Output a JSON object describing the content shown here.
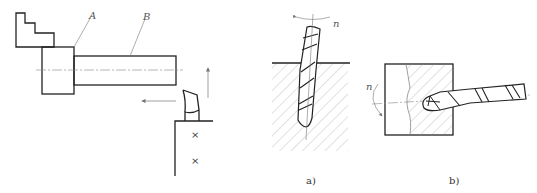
{
  "figure_left": {
    "labels": {
      "a": "A",
      "b": "B"
    },
    "parts": [
      "chuck-jaw",
      "chuck-body-A",
      "workpiece-shaft-B",
      "cutting-tool",
      "tool-post",
      "feed-arrow-horizontal",
      "feed-arrow-vertical"
    ],
    "tool_post_marks": [
      "×",
      "×"
    ]
  },
  "figure_a": {
    "rotation_label": "n",
    "caption": "a)",
    "description": "twist drill drilling vertically into hatched workpiece"
  },
  "figure_b": {
    "rotation_label": "n",
    "caption": "b)",
    "description": "twist drill drilling horizontally into rotating workpiece (lathe drilling)"
  },
  "colors": {
    "line": "#222222",
    "thin_line": "#777777",
    "hatch": "#999999",
    "background": "#ffffff"
  }
}
